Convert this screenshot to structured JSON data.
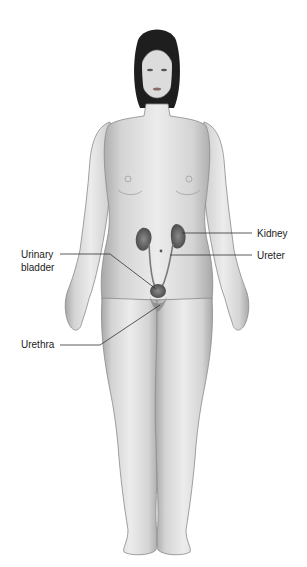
{
  "diagram": {
    "labels": {
      "kidney": "Kidney",
      "ureter": "Ureter",
      "urinary_bladder_line1": "Urinary",
      "urinary_bladder_line2": "bladder",
      "urethra": "Urethra"
    },
    "colors": {
      "skin": "#d9d9d9",
      "skin_shadow": "#9a9a9a",
      "hair": "#1e1e1e",
      "organ": "#6e6e6e",
      "leader_line": "#333333",
      "background": "#ffffff"
    }
  }
}
